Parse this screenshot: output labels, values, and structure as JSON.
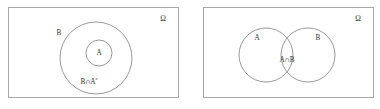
{
  "figure": {
    "type": "venn-diagram-pair",
    "background_color": "#ffffff",
    "frame_color": "#a8a8a8",
    "curve_color": "#8e8e8e",
    "text_color": "#2e2e2e"
  },
  "panels": [
    {
      "id": "left",
      "name": "nested-sets-panel",
      "universe_label": "Ω",
      "labels": {
        "outer_circle": "B",
        "inner_circle": "A",
        "annulus_base": "B∩A",
        "annulus_superscript": "c",
        "annulus_full": "B∩Aᶜ"
      },
      "shapes": [
        {
          "name": "outer-circle-b",
          "kind": "circle",
          "cx": 87,
          "cy": 50,
          "r": 36
        },
        {
          "name": "inner-circle-a",
          "kind": "circle",
          "cx": 90,
          "cy": 45,
          "r": 13
        }
      ]
    },
    {
      "id": "right",
      "name": "intersecting-sets-panel",
      "universe_label": "Ω",
      "labels": {
        "left_circle": "A",
        "right_circle": "B",
        "intersection": "A∩B"
      },
      "shapes": [
        {
          "name": "circle-a",
          "kind": "circle",
          "cx": 62,
          "cy": 47,
          "r": 27
        },
        {
          "name": "circle-b",
          "kind": "circle",
          "cx": 104,
          "cy": 47,
          "r": 27
        }
      ]
    }
  ]
}
